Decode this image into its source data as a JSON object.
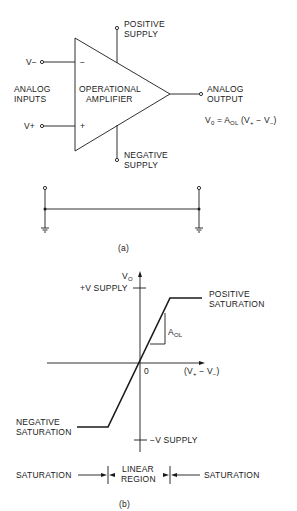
{
  "figure_a": {
    "caption": "(a)",
    "inputs_label": [
      "ANALOG",
      "INPUTS"
    ],
    "inverting_input": "V−",
    "noninverting_input": "V+",
    "minus_sign": "−",
    "plus_sign": "+",
    "amplifier_label": [
      "OPERATIONAL",
      "AMPLIFIER"
    ],
    "positive_supply": [
      "POSITIVE",
      "SUPPLY"
    ],
    "negative_supply": [
      "NEGATIVE",
      "SUPPLY"
    ],
    "output_label": [
      "ANALOG",
      "OUTPUT"
    ],
    "formula": {
      "v": "V",
      "v_sub": "0",
      "eq": " = A",
      "a_sub": "OL",
      "paren_open": " (V",
      "plus_sub": "+",
      "minus": " − V",
      "minus_sub": "−",
      "paren_close": ")"
    }
  },
  "figure_b": {
    "caption": "(b)",
    "y_axis_label": "V",
    "y_axis_sub": "O",
    "x_axis_label_parts": [
      "(V",
      "+",
      " − V",
      "−",
      ")"
    ],
    "origin_label": "0",
    "pos_supply_tick": "+V SUPPLY",
    "neg_supply_tick": "−V SUPPLY",
    "gain_label": "A",
    "gain_sub": "OL",
    "positive_saturation": [
      "POSITIVE",
      "SATURATION"
    ],
    "negative_saturation": [
      "NEGATIVE",
      "SATURATION"
    ],
    "regions": {
      "left": "SATURATION",
      "middle": [
        "LINEAR",
        "REGION"
      ],
      "right": "SATURATION"
    }
  }
}
